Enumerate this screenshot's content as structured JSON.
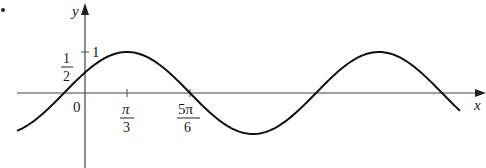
{
  "bullet": "•",
  "chart_data": {
    "type": "line",
    "title": "",
    "function": "y = sin(x + π/6)",
    "xlabel": "x",
    "ylabel": "y",
    "x_ticks": [
      {
        "value": 0,
        "label": "0"
      },
      {
        "value": 1.0472,
        "label": "π/3"
      },
      {
        "value": 2.618,
        "label": "5π/6"
      }
    ],
    "y_ticks": [
      {
        "value": 0.5,
        "label": "1/2"
      },
      {
        "value": 1,
        "label": "1"
      }
    ],
    "xlim": [
      -1.6,
      9.1
    ],
    "ylim": [
      -1.2,
      1.8
    ],
    "key_points": [
      {
        "x": 0,
        "y": 0.5
      },
      {
        "x": 1.0472,
        "y": 1
      },
      {
        "x": 2.618,
        "y": 0
      },
      {
        "x": 4.1888,
        "y": -1
      },
      {
        "x": 5.7596,
        "y": 0
      },
      {
        "x": 7.3304,
        "y": 1
      },
      {
        "x": 8.9012,
        "y": 0
      }
    ],
    "grid": false,
    "legend": null
  },
  "labels": {
    "y_axis": "y",
    "x_axis": "x",
    "origin": "0",
    "one": "1",
    "half_num": "1",
    "half_den": "2",
    "pi3_num": "π",
    "pi3_den": "3",
    "pi56_num": "5π",
    "pi56_den": "6"
  }
}
